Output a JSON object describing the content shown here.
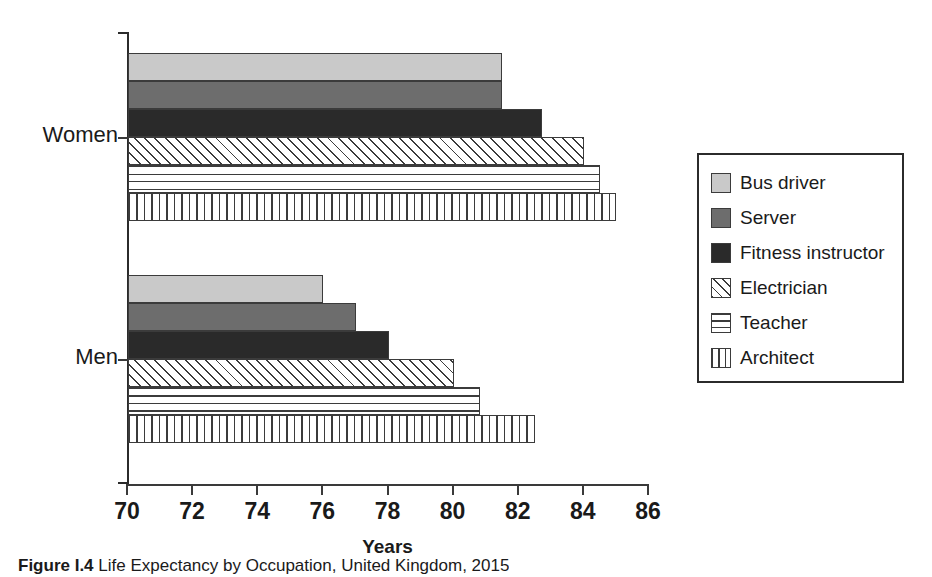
{
  "figure": {
    "caption_label": "Figure I.4",
    "caption_text": "Life Expectancy by Occupation, United Kingdom, 2015"
  },
  "chart_data": {
    "type": "bar",
    "orientation": "horizontal",
    "title": "",
    "xlabel": "Years",
    "ylabel": "",
    "xlim": [
      70,
      86
    ],
    "xticks": [
      70,
      72,
      74,
      76,
      78,
      80,
      82,
      84,
      86
    ],
    "xtick_labels": [
      "70",
      "72",
      "74",
      "76",
      "78",
      "80",
      "82",
      "84",
      "86"
    ],
    "categories": [
      "Women",
      "Men"
    ],
    "grid": false,
    "legend_position": "right",
    "series": [
      {
        "name": "Bus driver",
        "pattern": "solid-light",
        "color": "#c9c9c9",
        "values": [
          81.5,
          76.0
        ]
      },
      {
        "name": "Server",
        "pattern": "solid-mid",
        "color": "#6d6d6d",
        "values": [
          81.5,
          77.0
        ]
      },
      {
        "name": "Fitness instructor",
        "pattern": "solid-dark",
        "color": "#2a2a2a",
        "values": [
          82.7,
          78.0
        ]
      },
      {
        "name": "Electrician",
        "pattern": "diagonal",
        "color": "#ffffff",
        "values": [
          84.0,
          80.0
        ]
      },
      {
        "name": "Teacher",
        "pattern": "horizontal",
        "color": "#ffffff",
        "values": [
          84.5,
          80.8
        ]
      },
      {
        "name": "Architect",
        "pattern": "vertical",
        "color": "#ffffff",
        "values": [
          85.0,
          82.5
        ]
      }
    ]
  },
  "legend": {
    "items": [
      {
        "label": "Bus driver",
        "pattern": "solid-light"
      },
      {
        "label": "Server",
        "pattern": "solid-mid"
      },
      {
        "label": "Fitness instructor",
        "pattern": "solid-dark"
      },
      {
        "label": "Electrician",
        "pattern": "diagonal"
      },
      {
        "label": "Teacher",
        "pattern": "horizontal"
      },
      {
        "label": "Architect",
        "pattern": "vertical"
      }
    ]
  }
}
